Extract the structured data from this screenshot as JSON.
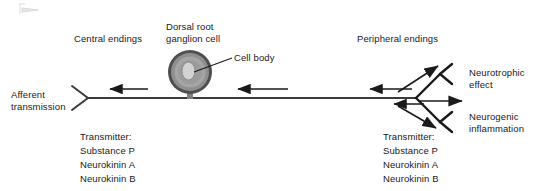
{
  "figure": {
    "type": "diagram",
    "background_color": "#ffffff",
    "text_color": "#1a1a1a",
    "line_color": "#3a3a3a",
    "arrow_color": "#1a1a1a",
    "cell_outer_color": "#4f4f4f",
    "cell_mid_color": "#9a9a9a",
    "cell_inner_color": "#b3b3b3",
    "cell_nucleus_color": "#cfcfcf"
  },
  "labels": {
    "central_endings": "Central endings",
    "dorsal_root_ganglion_cell": "Dorsal root\nganglion cell",
    "cell_body": "Cell body",
    "peripheral_endings": "Peripheral endings",
    "afferent_transmission": "Afferent\ntransmission",
    "neurotrophic_effect": "Neurotrophic\neffect",
    "neurogenic_inflammation": "Neurogenic\ninflammation"
  },
  "transmitter_left": {
    "heading": "Transmitter:",
    "items": [
      "Substance P",
      "Neurokinin A",
      "Neurokinin B"
    ]
  },
  "transmitter_right": {
    "heading": "Transmitter:",
    "items": [
      "Substance P",
      "Neurokinin A",
      "Neurokinin B"
    ]
  }
}
